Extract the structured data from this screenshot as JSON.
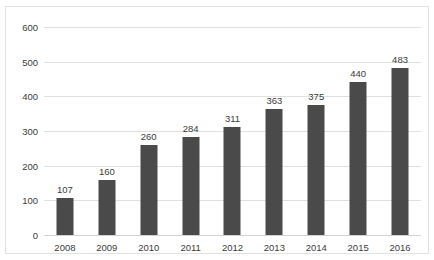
{
  "cropped_title": "",
  "chart_data": {
    "type": "bar",
    "title": "",
    "subtitle": "",
    "xlabel": "",
    "ylabel": "",
    "categories": [
      "2008",
      "2009",
      "2010",
      "2011",
      "2012",
      "2013",
      "2014",
      "2015",
      "2016"
    ],
    "values": [
      107,
      160,
      260,
      284,
      311,
      363,
      375,
      440,
      483
    ],
    "series": [
      {
        "name": "",
        "values": [
          107,
          160,
          260,
          284,
          311,
          363,
          375,
          440,
          483
        ]
      }
    ],
    "data_labels": [
      "107",
      "160",
      "260",
      "284",
      "311",
      "363",
      "375",
      "440",
      "483"
    ],
    "ylim": [
      0,
      600
    ],
    "ytick_values": [
      0,
      100,
      200,
      300,
      400,
      500,
      600
    ],
    "ytick_labels": [
      "0",
      "100",
      "200",
      "300",
      "400",
      "500",
      "600"
    ],
    "grid": true,
    "grid_axis": "y",
    "legend": false,
    "legend_position": "none",
    "bar_color": "#4a4a4a",
    "grid_color": "#e0e0e0",
    "background_color": "#ffffff",
    "text_color": "#3b3b3b",
    "border_color": "#e2e2e2"
  }
}
